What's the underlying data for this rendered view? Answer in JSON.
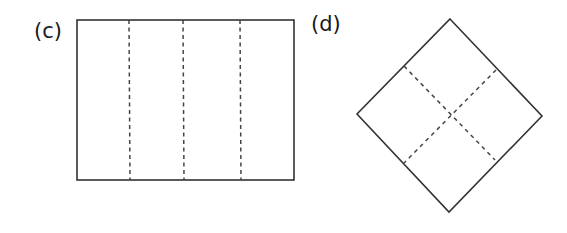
{
  "panels": [
    {
      "label": "(c)",
      "shape": "rectangle",
      "description": "Rectangle divided into four vertical strips by three dashed fold lines",
      "outline": {
        "x1": 77,
        "y1": 20,
        "x2": 294,
        "y2": 180
      },
      "fold_lines": [
        {
          "x1": 129,
          "y1": 20,
          "x2": 130,
          "y2": 180
        },
        {
          "x1": 183,
          "y1": 20,
          "x2": 184,
          "y2": 180
        },
        {
          "x1": 240,
          "y1": 20,
          "x2": 241,
          "y2": 180
        }
      ]
    },
    {
      "label": "(d)",
      "shape": "diamond",
      "description": "Square rotated 45 degrees divided into four smaller squares by two dashed fold lines crossing at the center",
      "vertices": {
        "top": [
          450,
          19
        ],
        "right": [
          542,
          116
        ],
        "bottom": [
          449,
          212
        ],
        "left": [
          357,
          114
        ]
      },
      "fold_lines": [
        {
          "x1": 404,
          "y1": 66,
          "x2": 495,
          "y2": 160
        },
        {
          "x1": 496,
          "y1": 70,
          "x2": 404,
          "y2": 163
        }
      ]
    }
  ],
  "colors": {
    "stroke": "#333333",
    "dash": "#444444",
    "background": "#ffffff"
  }
}
